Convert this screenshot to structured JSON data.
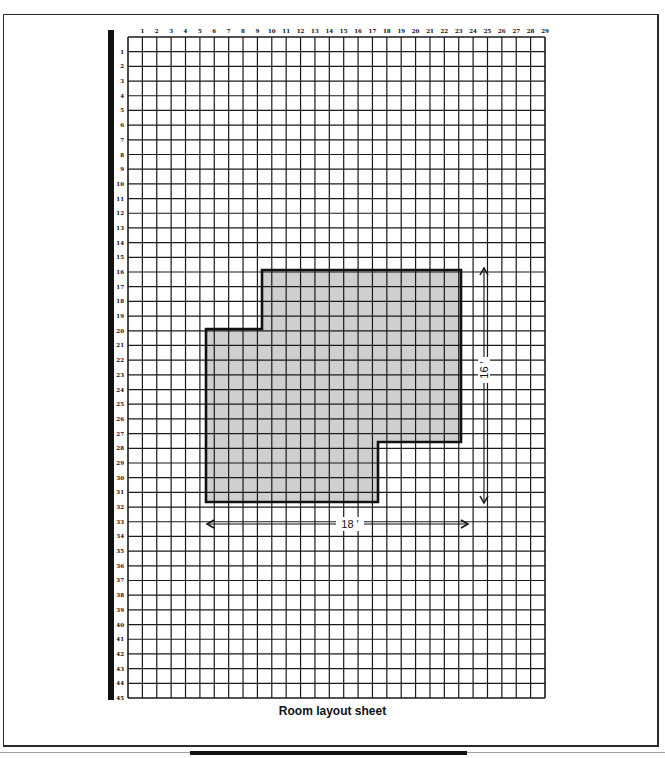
{
  "sheet": {
    "caption": "Room layout sheet",
    "grid": {
      "columns": 29,
      "rows": 45,
      "origin_px": [
        128,
        37
      ],
      "end_px": [
        545,
        698
      ],
      "column_labels": [
        "1",
        "2",
        "3",
        "4",
        "5",
        "6",
        "7",
        "8",
        "9",
        "10",
        "11",
        "12",
        "13",
        "14",
        "15",
        "16",
        "17",
        "18",
        "19",
        "20",
        "21",
        "22",
        "23",
        "24",
        "25",
        "26",
        "27",
        "28",
        "29"
      ],
      "row_labels": [
        "1",
        "2",
        "3",
        "4",
        "5",
        "6",
        "7",
        "8",
        "9",
        "10",
        "11",
        "12",
        "13",
        "14",
        "15",
        "16",
        "17",
        "18",
        "19",
        "20",
        "21",
        "22",
        "23",
        "24",
        "25",
        "26",
        "27",
        "28",
        "29",
        "30",
        "31",
        "32",
        "33",
        "34",
        "35",
        "36",
        "37",
        "38",
        "39",
        "40",
        "41",
        "42",
        "43",
        "44",
        "45"
      ]
    },
    "room": {
      "fill": "#cfcfcf",
      "outline": "#111111",
      "polygon_px": [
        [
          262,
          270
        ],
        [
          461,
          270
        ],
        [
          461,
          442
        ],
        [
          378,
          442
        ],
        [
          378,
          502
        ],
        [
          206,
          502
        ],
        [
          206,
          329
        ],
        [
          262,
          329
        ]
      ]
    },
    "dimensions": [
      {
        "label": "16 ′",
        "orientation": "vertical",
        "from_px": [
          484,
          268
        ],
        "to_px": [
          484,
          503
        ],
        "label_px": [
          484,
          370
        ]
      },
      {
        "label": "18 ′",
        "orientation": "horizontal",
        "from_px": [
          207,
          524
        ],
        "to_px": [
          468,
          524
        ],
        "label_px": [
          350,
          524
        ]
      }
    ],
    "colors": {
      "grid_line": "#1a1a1a",
      "paper": "#ffffff",
      "shade": "#cfcfcf"
    }
  }
}
